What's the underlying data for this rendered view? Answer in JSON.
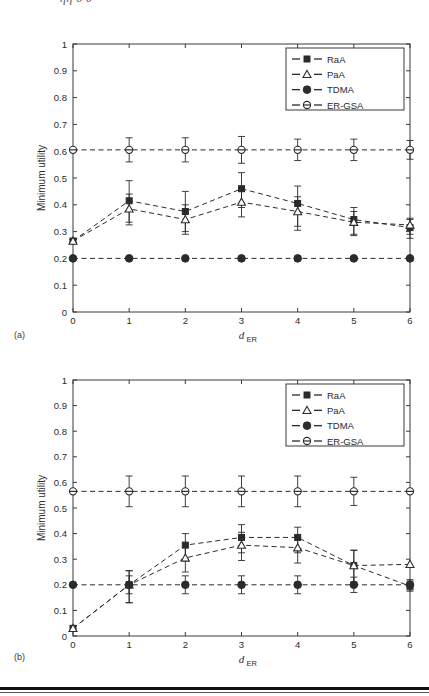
{
  "page": {
    "partial_header_text": "ηη       δ             δ",
    "panel_a_label": "(a)",
    "panel_b_label": "(b)"
  },
  "legend": {
    "entries": [
      {
        "label": "RaA",
        "marker": "filled-square"
      },
      {
        "label": "PaA",
        "marker": "open-triangle"
      },
      {
        "label": "TDMA",
        "marker": "filled-circle"
      },
      {
        "label": "ER-GSA",
        "marker": "circle-with-bar"
      }
    ]
  },
  "axis": {
    "ylabel": "Minimum utility",
    "xlabel_main": "d",
    "xlabel_sub": "ER",
    "yticks": [
      "0",
      "0.1",
      "0.2",
      "0.3",
      "0.4",
      "0.5",
      "0.6",
      "0.7",
      "0.8",
      "0.9",
      "1"
    ],
    "xticks": [
      "0",
      "1",
      "2",
      "3",
      "4",
      "5",
      "6"
    ]
  },
  "colors": {
    "line": "#2b2b2b",
    "text": "#2b2b2b",
    "frame": "#3a3a3a",
    "background": "#ffffff"
  },
  "chart_data": [
    {
      "id": "panel-a",
      "type": "line",
      "title": "(a)",
      "xlabel": "d_ER",
      "ylabel": "Minimum utility",
      "xlim": [
        0,
        6
      ],
      "ylim": [
        0,
        1
      ],
      "xticks": [
        0,
        1,
        2,
        3,
        4,
        5,
        6
      ],
      "yticks": [
        0,
        0.1,
        0.2,
        0.3,
        0.4,
        0.5,
        0.6,
        0.7,
        0.8,
        0.9,
        1
      ],
      "grid": false,
      "legend_position": "top-right",
      "x": [
        0,
        1,
        2,
        3,
        4,
        5,
        6
      ],
      "series": [
        {
          "name": "RaA",
          "marker": "filled-square",
          "values": [
            0.265,
            0.415,
            0.375,
            0.46,
            0.405,
            0.345,
            0.315
          ],
          "yerr_upper": [
            0.005,
            0.075,
            0.075,
            0.06,
            0.065,
            0.045,
            0.03
          ],
          "yerr_lower": [
            0.005,
            0.08,
            0.075,
            0.07,
            0.085,
            0.055,
            0.04
          ]
        },
        {
          "name": "PaA",
          "marker": "open-triangle",
          "values": [
            0.265,
            0.385,
            0.345,
            0.41,
            0.375,
            0.335,
            0.325
          ],
          "yerr_upper": [
            0.005,
            0.055,
            0.055,
            0.045,
            0.055,
            0.04,
            0.025
          ],
          "yerr_lower": [
            0.005,
            0.06,
            0.055,
            0.055,
            0.07,
            0.05,
            0.035
          ]
        },
        {
          "name": "TDMA",
          "marker": "filled-circle",
          "values": [
            0.2,
            0.2,
            0.2,
            0.2,
            0.2,
            0.2,
            0.2
          ],
          "yerr_upper": [
            0,
            0,
            0,
            0,
            0,
            0,
            0
          ],
          "yerr_lower": [
            0,
            0,
            0,
            0,
            0,
            0,
            0
          ]
        },
        {
          "name": "ER-GSA",
          "marker": "circle-with-bar",
          "values": [
            0.605,
            0.605,
            0.605,
            0.605,
            0.605,
            0.605,
            0.605
          ],
          "yerr_upper": [
            0,
            0.045,
            0.045,
            0.05,
            0.04,
            0.04,
            0.035
          ],
          "yerr_lower": [
            0,
            0.045,
            0.045,
            0.05,
            0.04,
            0.04,
            0.035
          ]
        }
      ]
    },
    {
      "id": "panel-b",
      "type": "line",
      "title": "(b)",
      "xlabel": "d_ER",
      "ylabel": "Minimum utility",
      "xlim": [
        0,
        6
      ],
      "ylim": [
        0,
        1
      ],
      "xticks": [
        0,
        1,
        2,
        3,
        4,
        5,
        6
      ],
      "yticks": [
        0,
        0.1,
        0.2,
        0.3,
        0.4,
        0.5,
        0.6,
        0.7,
        0.8,
        0.9,
        1
      ],
      "grid": false,
      "legend_position": "top-right",
      "x": [
        0,
        1,
        2,
        3,
        4,
        5,
        6
      ],
      "series": [
        {
          "name": "RaA",
          "marker": "filled-square",
          "values": [
            0.03,
            0.2,
            0.355,
            0.385,
            0.385,
            0.275,
            0.195
          ],
          "yerr_upper": [
            0.0,
            0.055,
            0.045,
            0.05,
            0.04,
            0.06,
            0.02
          ],
          "yerr_lower": [
            0.0,
            0.07,
            0.055,
            0.06,
            0.06,
            0.065,
            0.02
          ]
        },
        {
          "name": "PaA",
          "marker": "open-triangle",
          "values": [
            0.03,
            0.2,
            0.305,
            0.355,
            0.345,
            0.275,
            0.28
          ],
          "yerr_upper": [
            0.0,
            0.055,
            0.045,
            0.05,
            0.04,
            0.06,
            0.0
          ],
          "yerr_lower": [
            0.0,
            0.07,
            0.055,
            0.06,
            0.06,
            0.065,
            0.0
          ]
        },
        {
          "name": "TDMA",
          "marker": "filled-circle",
          "values": [
            0.2,
            0.2,
            0.2,
            0.2,
            0.2,
            0.2,
            0.2
          ],
          "yerr_upper": [
            0,
            0.035,
            0.035,
            0.035,
            0.035,
            0.03,
            0.02
          ],
          "yerr_lower": [
            0,
            0.035,
            0.035,
            0.035,
            0.035,
            0.03,
            0.02
          ]
        },
        {
          "name": "ER-GSA",
          "marker": "circle-with-bar",
          "values": [
            0.565,
            0.565,
            0.565,
            0.565,
            0.565,
            0.565,
            0.565
          ],
          "yerr_upper": [
            0,
            0.06,
            0.06,
            0.06,
            0.06,
            0.055,
            0.0
          ],
          "yerr_lower": [
            0,
            0.06,
            0.06,
            0.06,
            0.06,
            0.055,
            0.0
          ]
        }
      ]
    }
  ]
}
